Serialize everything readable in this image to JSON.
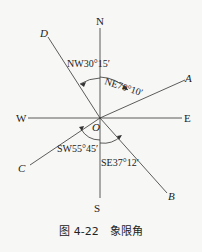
{
  "diagram": {
    "axes": {
      "north": "N",
      "south": "S",
      "east": "E",
      "west": "W"
    },
    "origin": "O",
    "points": {
      "a": "A",
      "b": "B",
      "c": "C",
      "d": "D"
    },
    "angles": {
      "ne": "NE70°10′",
      "nw": "NW30°15′",
      "sw": "SW55°45′",
      "se": "SE37°12′"
    }
  },
  "caption": "图 4-22　象限角"
}
